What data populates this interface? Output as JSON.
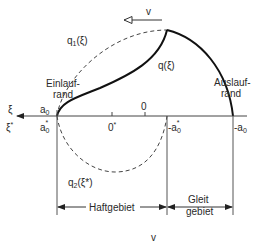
{
  "diagram": {
    "type": "contact pressure distribution (rolling contact, Haft-/Gleitgebiet)",
    "velocity": {
      "label": "v",
      "direction": "left"
    },
    "curves": [
      {
        "name": "q1",
        "label": "q",
        "sub": "1",
        "arg": "(ξ)",
        "style": "dashed",
        "description": "upper dashed semi-ellipse from a0 to -a0*"
      },
      {
        "name": "q",
        "label": "q(ξ)",
        "style": "solid",
        "description": "resulting tangential stress, rises from a0 to peak at -a0*, then falls to -a0"
      },
      {
        "name": "q2",
        "label": "q",
        "sub": "2",
        "arg": "(ξ*)",
        "style": "dashed",
        "description": "lower dashed semi-ellipse from a0* to -a0*"
      }
    ],
    "axes": {
      "xi_label": "ξ",
      "xi_star_label": "ξ*",
      "ticks_top": [
        {
          "label": "a",
          "sub": "0"
        },
        {
          "label": "0"
        }
      ],
      "ticks_bottom": [
        {
          "label": "a",
          "sub": "0",
          "star": true
        },
        {
          "label": "0",
          "star": true
        },
        {
          "label": "-a",
          "sub": "0",
          "star": true
        },
        {
          "label": "-a",
          "sub": "0"
        }
      ]
    },
    "annotations": {
      "einlauf": [
        "Einlauf-",
        "rand"
      ],
      "auslauf": [
        "Auslauf-",
        "rand"
      ]
    },
    "regions": {
      "haft": "Haftgebiet",
      "gleit": [
        "Gleit",
        "gebiet"
      ]
    },
    "footer": "v"
  }
}
